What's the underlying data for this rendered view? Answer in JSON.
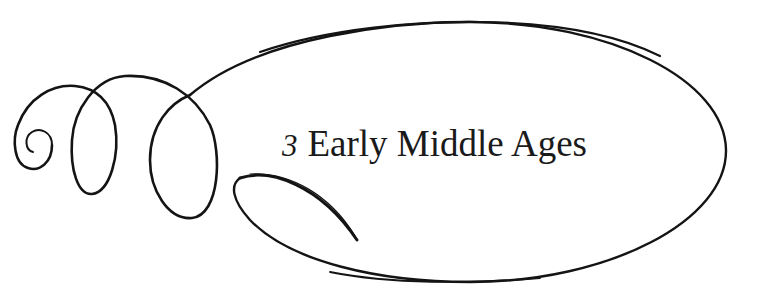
{
  "heading": {
    "chapter_number": "3",
    "chapter_title": "Early Middle Ages"
  },
  "ornament": {
    "stroke_color": "#141414",
    "background_color": "#ffffff",
    "icon": "calligraphic-flourish-oval"
  }
}
